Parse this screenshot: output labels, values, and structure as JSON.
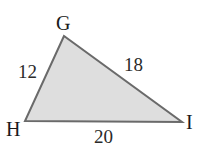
{
  "figure": {
    "type": "triangle",
    "fill_color": "#dedede",
    "stroke_color": "#6a6a6a",
    "vertices": [
      {
        "name": "G",
        "x": 64,
        "y": 36
      },
      {
        "name": "H",
        "x": 25,
        "y": 121
      },
      {
        "name": "I",
        "x": 182,
        "y": 122
      }
    ],
    "vertex_labels": {
      "G": "G",
      "H": "H",
      "I": "I"
    },
    "sides": {
      "GH": "12",
      "GI": "18",
      "HI": "20"
    }
  }
}
